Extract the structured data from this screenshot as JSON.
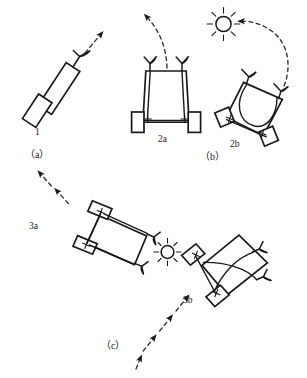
{
  "figure": {
    "background_color": "#ffffff",
    "ink_color": "#1a1a1a",
    "width": 307,
    "height": 378,
    "caption": ""
  },
  "panels": [
    {
      "id": "a",
      "label": "（a）",
      "vehicles": [
        {
          "id": "1",
          "label": "1",
          "sensors": 1,
          "motors": 1,
          "wiring": "direct",
          "motion": "straight ahead"
        }
      ],
      "light_sources": 0,
      "trajectories": 1
    },
    {
      "id": "b",
      "label": "（b）",
      "vehicles": [
        {
          "id": "2a",
          "label": "2a",
          "sensors": 2,
          "motors": 2,
          "wiring": "uncrossed",
          "motion": "turns away from light"
        },
        {
          "id": "2b",
          "label": "2b",
          "sensors": 2,
          "motors": 2,
          "wiring": "crossed",
          "motion": "turns toward light"
        }
      ],
      "light_sources": 1,
      "trajectories": 2
    },
    {
      "id": "c",
      "label": "（c）",
      "vehicles": [
        {
          "id": "3a",
          "label": "3a",
          "sensors": 2,
          "motors": 2,
          "wiring": "uncrossed",
          "motion": "fleeing the light"
        },
        {
          "id": "3b",
          "label": "3b",
          "sensors": 2,
          "motors": 2,
          "wiring": "crossed",
          "motion": "approaching the light"
        }
      ],
      "light_sources": 1,
      "trajectories": 2
    }
  ],
  "labels": {
    "vehicle_1": "1",
    "vehicle_2a": "2a",
    "vehicle_2b": "2b",
    "vehicle_3a": "3a",
    "vehicle_3b": "3b",
    "panel_a": "（a）",
    "panel_b": "（b）",
    "panel_c": "（c）"
  },
  "symbols": {
    "motor_mark": "+",
    "sensor_icon": "y-sensor-icon",
    "light_icon": "sun-icon",
    "path_icon": "dashed-arrow-icon"
  }
}
